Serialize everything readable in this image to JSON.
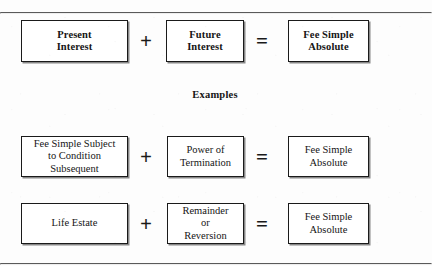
{
  "diagram": {
    "caption": "Examples",
    "operators": {
      "plus": "+",
      "equals": "="
    },
    "rows": [
      {
        "id": "definition",
        "emphasis": "bold",
        "left_box": "Present\nInterest",
        "operator_1": "+",
        "middle_box": "Future\nInterest",
        "operator_2": "=",
        "right_box": "Fee Simple\nAbsolute"
      },
      {
        "id": "example-1",
        "emphasis": "normal",
        "left_box": "Fee Simple Subject\nto Condition\nSubsequent",
        "operator_1": "+",
        "middle_box": "Power of\nTermination",
        "operator_2": "=",
        "right_box": "Fee Simple\nAbsolute"
      },
      {
        "id": "example-2",
        "emphasis": "normal",
        "left_box": "Life Estate",
        "operator_1": "+",
        "middle_box": "Remainder\nor\nReversion",
        "operator_2": "=",
        "right_box": "Fee Simple\nAbsolute"
      }
    ]
  },
  "colors": {
    "page_background": "#fdfdfd",
    "box_border": "#1a1a1a",
    "box_fill": "#ffffff",
    "text": "#151515",
    "rule": "#5a5a5a"
  }
}
